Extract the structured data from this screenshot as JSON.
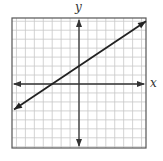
{
  "chart_data": {
    "type": "line",
    "title": "",
    "xlabel": "x",
    "ylabel": "y",
    "xlim": [
      -7.5,
      7.5
    ],
    "ylim": [
      -7,
      7.5
    ],
    "grid": true,
    "grid_step": 1,
    "axes_arrows": true,
    "series": [
      {
        "name": "line",
        "equation": "y = (2/3)x + 2",
        "slope": 0.6667,
        "y_intercept": 2,
        "x_intercept": -3,
        "x": [
          -7.5,
          7.5
        ],
        "y": [
          -3,
          7
        ],
        "arrows": "both",
        "color": "#222222"
      }
    ]
  },
  "labels": {
    "x": "x",
    "y": "y"
  },
  "colors": {
    "grid": "#c8c8c8",
    "axis": "#333333",
    "border": "#555555",
    "line": "#222222"
  }
}
